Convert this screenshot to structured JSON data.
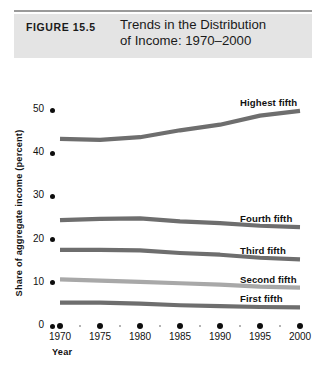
{
  "header": {
    "figure_label": "FIGURE 15.5",
    "title_line1": "Trends in the Distribution",
    "title_line2": "of Income: 1970–2000",
    "band_color": "#e4e4e4",
    "rule_color": "#9a9a9a"
  },
  "chart_data": {
    "type": "line",
    "title": "Trends in the Distribution of Income: 1970–2000",
    "xlabel": "Year",
    "ylabel": "Share of aggregate income (percent)",
    "x": [
      1970,
      1975,
      1980,
      1985,
      1990,
      1995,
      2000
    ],
    "xlim": [
      1970,
      2000
    ],
    "ylim": [
      0,
      52
    ],
    "yticks": [
      0,
      10,
      20,
      30,
      40,
      50
    ],
    "xticks": [
      1970,
      1975,
      1980,
      1985,
      1990,
      1995,
      2000
    ],
    "xtick_labels": [
      "1970",
      "1975",
      "1980",
      "1985",
      "1990",
      "1995",
      "2000"
    ],
    "ytick_labels": [
      "0",
      "10",
      "20",
      "30",
      "40",
      "50"
    ],
    "grid": false,
    "legend": "right-inline-labels",
    "series": [
      {
        "name": "Highest fifth",
        "color": "#6e6e6e",
        "values": [
          43.3,
          43.1,
          43.7,
          45.3,
          46.6,
          48.7,
          49.8
        ]
      },
      {
        "name": "Fourth fifth",
        "color": "#6e6e6e",
        "values": [
          24.5,
          24.8,
          24.9,
          24.2,
          23.8,
          23.2,
          22.9
        ]
      },
      {
        "name": "Third fifth",
        "color": "#6e6e6e",
        "values": [
          17.6,
          17.6,
          17.5,
          16.9,
          16.5,
          15.8,
          15.4
        ]
      },
      {
        "name": "Second fifth",
        "color": "#a8a8a8",
        "values": [
          10.8,
          10.5,
          10.2,
          9.9,
          9.6,
          9.1,
          8.9
        ]
      },
      {
        "name": "First fifth",
        "color": "#6e6e6e",
        "values": [
          5.4,
          5.4,
          5.2,
          4.8,
          4.6,
          4.4,
          4.3
        ]
      }
    ]
  }
}
